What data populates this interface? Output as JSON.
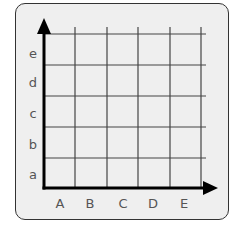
{
  "diagram": {
    "type": "coordinate-grid",
    "x_axis_labels": [
      "A",
      "B",
      "C",
      "D",
      "E"
    ],
    "y_axis_labels": [
      "a",
      "b",
      "c",
      "d",
      "e"
    ],
    "colors": {
      "card_background": "#efefef",
      "card_border": "#333333",
      "grid_line": "#444444",
      "axis": "#000000",
      "label": "#555555"
    }
  }
}
